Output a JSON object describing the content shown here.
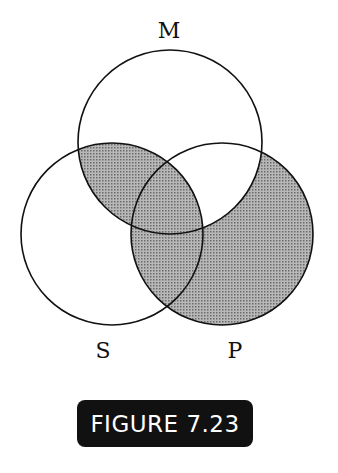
{
  "diagram": {
    "type": "venn",
    "sets": [
      {
        "label": "M",
        "cx": 170,
        "cy": 142,
        "r": 92
      },
      {
        "label": "S",
        "cx": 112,
        "cy": 234,
        "r": 91
      },
      {
        "label": "P",
        "cx": 222,
        "cy": 234,
        "r": 91
      }
    ],
    "shaded_regions": [
      "M∩S∩¬P",
      "M∩S∩P",
      "S∩P∩¬M",
      "P∩¬M∩¬S"
    ],
    "shade_color": "#9a9a9a"
  },
  "labels": {
    "m": "M",
    "s": "S",
    "p": "P"
  },
  "figure_caption": "FIGURE 7.23"
}
